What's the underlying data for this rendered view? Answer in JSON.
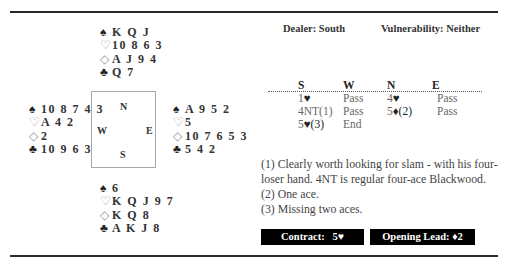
{
  "header": {
    "dealer": "Dealer: South",
    "vulnerability": "Vulnerability: Neither"
  },
  "compass": {
    "north": "N",
    "south": "S",
    "east": "E",
    "west": "W"
  },
  "hands": {
    "north": {
      "spades": "K Q J",
      "hearts": "10 8 6 3",
      "diamonds": "A J 9 4",
      "clubs": "Q 7"
    },
    "west": {
      "spades": "10 8 7 4 3",
      "hearts": "A 4 2",
      "diamonds": "2",
      "clubs": "10 9 6 3"
    },
    "east": {
      "spades": "A 9 5 2",
      "hearts": "5",
      "diamonds": "10 7 6 5 3",
      "clubs": "5 4 2"
    },
    "south": {
      "spades": "6",
      "hearts": "K Q J 9 7",
      "diamonds": "K Q 8",
      "clubs": "A K J 8"
    }
  },
  "suits": {
    "spade": "♠",
    "heart": "♡",
    "diamond": "◇",
    "club": "♣",
    "heart_solid": "♥",
    "diamond_solid": "♦"
  },
  "bidding": {
    "columns": [
      "S",
      "W",
      "N",
      "E"
    ],
    "rows": [
      [
        "1",
        "Pass",
        "4",
        "Pass"
      ],
      [
        "4NT(1)",
        "Pass",
        "5",
        "Pass"
      ],
      [
        "5",
        "End"
      ]
    ],
    "suffixes": {
      "r0c0": "♥",
      "r0c2": "♥",
      "r1c2": "♦(2)",
      "r2c0": "♥(3)"
    }
  },
  "notes": [
    "(1) Clearly worth looking for slam - with his four-",
    "loser hand. 4NT is regular four-ace Blackwood.",
    "(2) One ace.",
    "(3) Missing two aces."
  ],
  "contract": {
    "label": "Contract:",
    "value": "5♥"
  },
  "opening_lead": {
    "label": "Opening Lead:",
    "value": "♦2"
  }
}
